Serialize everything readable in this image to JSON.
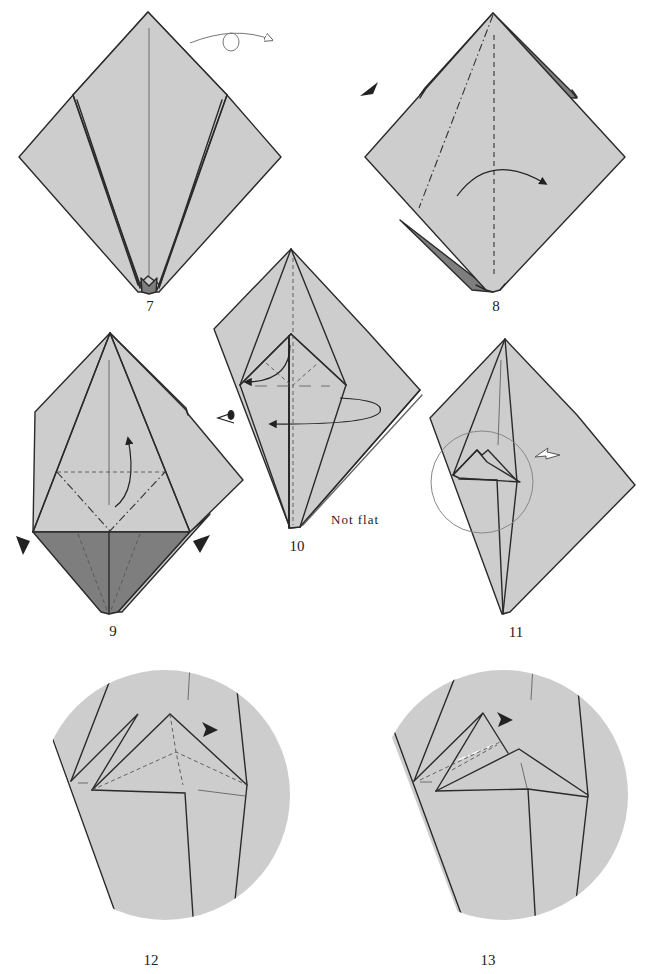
{
  "page": {
    "type": "origami-instructions",
    "paper_color": "#cdcdcd",
    "paper_reverse_color": "#7e7e7e",
    "line_color": "#2a2a2a"
  },
  "steps": [
    {
      "number": "7",
      "symbols": [
        "turn-over-arrow"
      ],
      "description": "Kite-shaped base with narrow flaps; turn over"
    },
    {
      "number": "8",
      "symbols": [
        "push-arrowhead",
        "valley-fold",
        "mountain-fold",
        "curved-fold-arrow"
      ],
      "description": "Mountain and valley crease, fold flap to the right"
    },
    {
      "number": "9",
      "symbols": [
        "push-arrowhead-left",
        "push-arrowhead-right",
        "valley-fold",
        "mountain-fold",
        "curved-fold-arrow"
      ],
      "description": "Lift lower section upward along creases"
    },
    {
      "number": "10",
      "symbols": [
        "view-eye",
        "curved-arrow-left",
        "loop-arrow"
      ],
      "description": "Swing layers behind",
      "note": "Not flat"
    },
    {
      "number": "11",
      "symbols": [
        "magnify-circle",
        "hollow-arrow"
      ],
      "description": "Enlarged view follows"
    },
    {
      "number": "12",
      "symbols": [
        "push-arrowhead",
        "valley-fold"
      ],
      "description": "Close-up of head area"
    },
    {
      "number": "13",
      "symbols": [
        "push-arrowhead",
        "mountain-fold",
        "valley-fold"
      ],
      "description": "Close-up, reverse fold"
    }
  ],
  "labels": {
    "step7": "7",
    "step8": "8",
    "step9": "9",
    "step10": "10",
    "step10_note": "Not flat",
    "step11": "11",
    "step12": "12",
    "step13": "13"
  }
}
